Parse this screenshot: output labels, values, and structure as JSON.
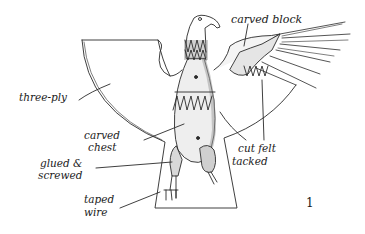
{
  "diagram": {
    "figure_number": "1",
    "labels": {
      "carved_block": "carved block",
      "three_ply": "three-ply",
      "carved_chest_1": "carved",
      "carved_chest_2": "chest",
      "glued_1": "glued &",
      "glued_2": "screwed",
      "taped_1": "taped",
      "taped_2": "wire",
      "cut_felt_1": "cut felt",
      "cut_felt_2": "tacked"
    },
    "colors": {
      "ink": "#1a1a1a",
      "shade": "#bdbdbd",
      "background": "#ffffff"
    }
  }
}
